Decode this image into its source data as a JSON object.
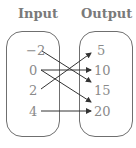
{
  "headers": {
    "input": "Input",
    "output": "Output"
  },
  "inputs": [
    "−2",
    "0",
    "2",
    "4"
  ],
  "outputs": [
    "5",
    "10",
    "15",
    "20"
  ],
  "mappings": [
    {
      "from": "-2",
      "to": "15"
    },
    {
      "from": "0",
      "to": "10"
    },
    {
      "from": "0",
      "to": "20"
    },
    {
      "from": "2",
      "to": "5"
    },
    {
      "from": "4",
      "to": "20"
    }
  ],
  "colors": {
    "text": "#8a8a8a",
    "header": "#7a7a7a",
    "border": "#6f6f6f",
    "arrow": "#333333"
  }
}
